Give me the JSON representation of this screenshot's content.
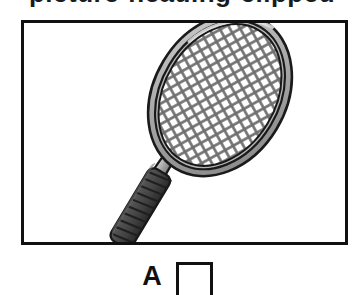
{
  "page": {
    "background_color": "#ffffff",
    "width": 364,
    "height": 295,
    "clipped_title": "picture-heading-clipped"
  },
  "picture_frame": {
    "name": "picture-frame",
    "border_color": "#111111",
    "background_color": "#ffffff",
    "illustration": {
      "subject": "tennis-racket",
      "description": "line drawing of a tennis racket tilted diagonally, head upper-right, grip lower-left",
      "colors": {
        "outline": "#1a1a1a",
        "frame_light": "#c9c9c9",
        "frame_mid": "#9a9a9a",
        "frame_shadow": "#7a7a7a",
        "string_color": "#6e6e6e",
        "string_bed": "#ffffff",
        "grip_dark": "#4a4a4a",
        "grip_band": "#2e2e2e"
      }
    }
  },
  "answer_row": {
    "name": "answer-row",
    "letter": "A",
    "checkbox": {
      "name": "answer-checkbox-a",
      "checked": false,
      "border_color": "#111111",
      "fill_color": "#ffffff"
    }
  }
}
